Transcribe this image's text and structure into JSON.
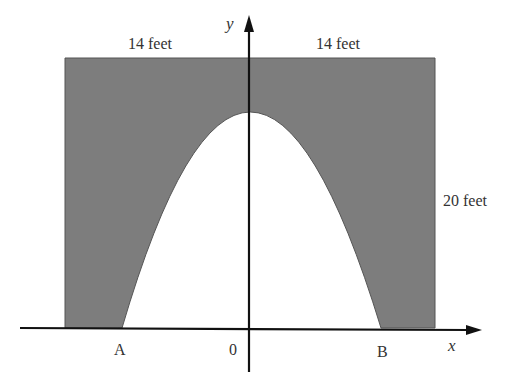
{
  "diagram": {
    "labels": {
      "top_left_width": "14 feet",
      "top_right_width": "14 feet",
      "height": "20 feet",
      "point_a": "A",
      "point_b": "B",
      "origin": "0",
      "x_axis": "x",
      "y_axis": "y"
    },
    "colors": {
      "shaded": "#7d7d7d",
      "axis": "#111111",
      "background": "#ffffff"
    },
    "geometry": {
      "half_width_feet": 14,
      "height_feet": 20,
      "shape": "rectangle with parabolic arch cut out"
    }
  }
}
